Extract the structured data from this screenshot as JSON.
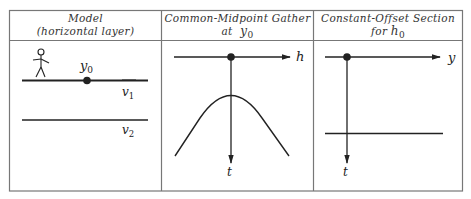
{
  "figure": {
    "panels": [
      {
        "id": "model",
        "title_line1": "Model",
        "title_line2": "(horizontal layer)",
        "labels": {
          "point": "y",
          "point_sub": "0",
          "layer1": "v",
          "layer1_sub": "1",
          "layer2": "v",
          "layer2_sub": "2"
        }
      },
      {
        "id": "cmp-gather",
        "title_line1": "Common-Midpoint Gather",
        "title_line2_prefix": "at ",
        "title_line2_var": "y",
        "title_line2_sub": "0",
        "labels": {
          "x_axis": "h",
          "y_axis": "t"
        }
      },
      {
        "id": "constant-offset",
        "title_line1": "Constant-Offset Section",
        "title_line2_prefix": "for ",
        "title_line2_var": "h",
        "title_line2_sub": "0",
        "labels": {
          "x_axis": "y",
          "y_axis": "t"
        }
      }
    ],
    "colors": {
      "line": "#222222",
      "frame": "#777777",
      "background": "#ffffff"
    }
  }
}
